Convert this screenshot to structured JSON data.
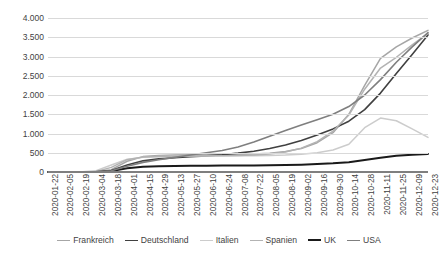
{
  "chart_data": {
    "type": "line",
    "title": "",
    "subtitle": "",
    "xlabel": "",
    "ylabel": "",
    "ylim": [
      0,
      4000
    ],
    "ytick_labels": [
      "0",
      "500",
      "1.000",
      "1.500",
      "2.000",
      "2.500",
      "3.000",
      "3.500",
      "4.000"
    ],
    "ytick_values": [
      0,
      500,
      1000,
      1500,
      2000,
      2500,
      3000,
      3500,
      4000
    ],
    "grid": true,
    "legend_position": "bottom",
    "x": [
      "2020-01-22",
      "2020-02-05",
      "2020-02-19",
      "2020-03-04",
      "2020-03-18",
      "2020-04-01",
      "2020-04-15",
      "2020-04-29",
      "2020-05-13",
      "2020-05-27",
      "2020-06-10",
      "2020-06-24",
      "2020-07-08",
      "2020-07-22",
      "2020-08-05",
      "2020-08-19",
      "2020-09-02",
      "2020-09-16",
      "2020-09-30",
      "2020-10-14",
      "2020-10-28",
      "2020-11-11",
      "2020-11-25",
      "2020-12-09",
      "2020-12-23"
    ],
    "series": [
      {
        "name": "Frankreich",
        "color": "#a6a6a6",
        "width": 1.5,
        "values": [
          0,
          0,
          0,
          5,
          60,
          280,
          400,
          430,
          440,
          445,
          450,
          455,
          460,
          470,
          490,
          530,
          610,
          760,
          1020,
          1500,
          2250,
          2950,
          3250,
          3480,
          3680
        ]
      },
      {
        "name": "Deutschland",
        "color": "#404040",
        "width": 1.6,
        "values": [
          0,
          0,
          0,
          4,
          40,
          180,
          290,
          340,
          370,
          395,
          420,
          450,
          490,
          540,
          610,
          700,
          820,
          960,
          1120,
          1320,
          1620,
          2050,
          2560,
          3050,
          3560
        ]
      },
      {
        "name": "Italien",
        "color": "#cccccc",
        "width": 1.5,
        "values": [
          0,
          0,
          2,
          30,
          180,
          330,
          380,
          400,
          410,
          415,
          418,
          420,
          422,
          425,
          430,
          440,
          460,
          500,
          570,
          720,
          1150,
          1400,
          1330,
          1120,
          900
        ]
      },
      {
        "name": "Spanien",
        "color": "#b3b3b3",
        "width": 1.5,
        "values": [
          0,
          0,
          0,
          8,
          120,
          320,
          390,
          405,
          410,
          415,
          420,
          425,
          430,
          440,
          465,
          520,
          620,
          790,
          1060,
          1480,
          2150,
          2700,
          2980,
          3300,
          3600
        ]
      },
      {
        "name": "UK",
        "color": "#1a1a1a",
        "width": 2.0,
        "values": [
          0,
          0,
          0,
          2,
          25,
          95,
          135,
          150,
          158,
          162,
          165,
          168,
          170,
          172,
          175,
          180,
          190,
          205,
          225,
          255,
          310,
          370,
          420,
          445,
          470
        ]
      },
      {
        "name": "USA",
        "color": "#7f7f7f",
        "width": 1.6,
        "values": [
          0,
          0,
          0,
          3,
          30,
          150,
          250,
          320,
          380,
          440,
          500,
          560,
          650,
          780,
          930,
          1080,
          1220,
          1360,
          1500,
          1700,
          2000,
          2400,
          2850,
          3250,
          3620
        ]
      }
    ]
  },
  "legend": {
    "items": [
      {
        "label": "Frankreich"
      },
      {
        "label": "Deutschland"
      },
      {
        "label": "Italien"
      },
      {
        "label": "Spanien"
      },
      {
        "label": "UK"
      },
      {
        "label": "USA"
      }
    ]
  }
}
